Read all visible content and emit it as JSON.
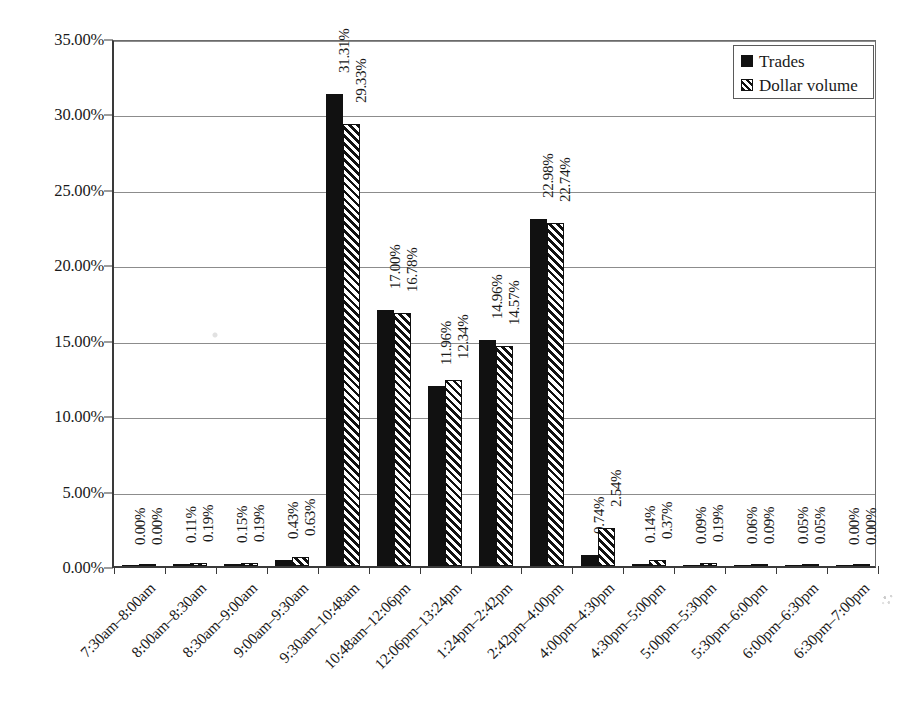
{
  "chart_data": {
    "type": "bar",
    "title": "",
    "subtitle": "",
    "xlabel": "",
    "ylabel": "",
    "ylim": [
      0,
      35
    ],
    "ytick_labels": [
      "0.00%",
      "5.00%",
      "10.00%",
      "15.00%",
      "20.00%",
      "25.00%",
      "30.00%",
      "35.00%"
    ],
    "ytick_values": [
      0,
      5,
      10,
      15,
      20,
      25,
      30,
      35
    ],
    "grid": true,
    "legend_position": "top-right",
    "categories": [
      "7:30am–8:00am",
      "8:00am–8:30am",
      "8:30am–9:00am",
      "9:00am–9:30am",
      "9:30am–10:48am",
      "10:48am–12:06pm",
      "12:06pm–13:24pm",
      "1:24pm–2:42pm",
      "2:42pm–4:00pm",
      "4:00pm–4:30pm",
      "4:30pm–5:00pm",
      "5:00pm–5:30pm",
      "5:30pm–6:00pm",
      "6:00pm–6:30pm",
      "6:30pm–7:00pm"
    ],
    "series": [
      {
        "name": "Trades",
        "style": "solid-black",
        "values": [
          0.0,
          0.11,
          0.15,
          0.43,
          31.31,
          17.0,
          11.96,
          14.96,
          22.98,
          0.74,
          0.14,
          0.09,
          0.06,
          0.05,
          0.0
        ],
        "labels": [
          "0.00%",
          "0.11%",
          "0.15%",
          "0.43%",
          "31.31%",
          "17.00%",
          "11.96%",
          "14.96%",
          "22.98%",
          "0.74%",
          "0.14%",
          "0.09%",
          "0.06%",
          "0.05%",
          "0.00%"
        ]
      },
      {
        "name": "Dollar volume",
        "style": "diagonal-hatch",
        "values": [
          0.0,
          0.19,
          0.19,
          0.63,
          29.33,
          16.78,
          12.34,
          14.57,
          22.74,
          2.54,
          0.37,
          0.19,
          0.09,
          0.05,
          0.0
        ],
        "labels": [
          "0.00%",
          "0.19%",
          "0.19%",
          "0.63%",
          "29.33%",
          "16.78%",
          "12.34%",
          "14.57%",
          "22.74%",
          "2.54%",
          "0.37%",
          "0.19%",
          "0.09%",
          "0.05%",
          "0.00%"
        ]
      }
    ]
  },
  "legend": {
    "items": [
      {
        "label": "Trades",
        "swatch": "solid"
      },
      {
        "label": "Dollar volume",
        "swatch": "hatch"
      }
    ]
  },
  "colors": {
    "series_trades": "#111111",
    "series_dollar_volume": "#111111",
    "gridline": "#8c8c8c",
    "axis": "#3a3a3a",
    "background": "#ffffff",
    "text": "#1a1a1a"
  }
}
